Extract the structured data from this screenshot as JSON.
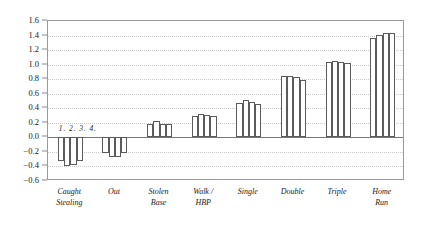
{
  "chart_data": {
    "type": "bar",
    "title": "",
    "subtitle": "",
    "xlabel": "",
    "ylabel": "",
    "ylim": [
      -0.6,
      1.6
    ],
    "ytick_step": 0.2,
    "yticks": [
      "1.6",
      "1.4",
      "1.2",
      "1.0",
      "0.8",
      "0.6",
      "0.4",
      "0.2",
      "0.0",
      "-0.2",
      "-0.4",
      "-0.6"
    ],
    "grid": true,
    "grid_style": "dotted",
    "legend": "none",
    "annotation": "1. 2. 3. 4.",
    "bar_fill": "#ffffff",
    "bar_stroke": "#5b5b5b",
    "frame_color": "#9a9a9a",
    "grid_color": "#c9c9c9",
    "zero_line_color": "#777777",
    "categories": [
      "Caught Stealing",
      "Out",
      "Stolen Base",
      "Walk / HBP",
      "Single",
      "Double",
      "Triple",
      "Home Run"
    ],
    "category_lines": [
      [
        "Caught",
        "Stealing"
      ],
      [
        "Out"
      ],
      [
        "Stolen",
        "Base"
      ],
      [
        "Walk /",
        "HBP"
      ],
      [
        "Single"
      ],
      [
        "Double"
      ],
      [
        "Triple"
      ],
      [
        "Home",
        "Run"
      ]
    ],
    "series": [
      {
        "name": "1.",
        "values": [
          -0.32,
          -0.22,
          0.19,
          0.3,
          0.47,
          0.84,
          1.03,
          1.37
        ]
      },
      {
        "name": "2.",
        "values": [
          -0.39,
          -0.27,
          0.22,
          0.32,
          0.51,
          0.85,
          1.05,
          1.41
        ]
      },
      {
        "name": "3.",
        "values": [
          -0.38,
          -0.27,
          0.19,
          0.31,
          0.49,
          0.83,
          1.04,
          1.43
        ]
      },
      {
        "name": "4.",
        "values": [
          -0.32,
          -0.22,
          0.19,
          0.29,
          0.46,
          0.79,
          1.02,
          1.43
        ]
      }
    ]
  }
}
